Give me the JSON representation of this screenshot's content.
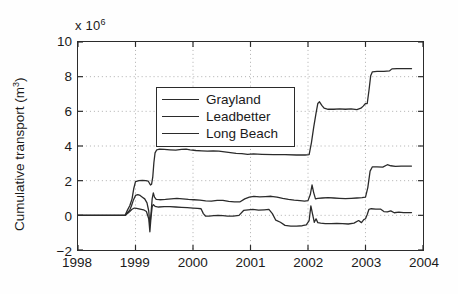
{
  "figure": {
    "exponent_label": "x 10",
    "exponent_power": "6",
    "ylabel_text": "Cumulative transport (m",
    "ylabel_sup": "3",
    "ylabel_close": ")",
    "axis_color": "#2b2b2b",
    "grid_color": "#9a9a9a",
    "background": "#ffffff"
  },
  "legend": {
    "position": "top-left-inside",
    "entries": [
      {
        "label": "Grayland",
        "color": "#2b2b2b"
      },
      {
        "label": "Leadbetter",
        "color": "#2b2b2b"
      },
      {
        "label": "Long Beach",
        "color": "#2b2b2b"
      }
    ]
  },
  "chart_data": {
    "type": "line",
    "title": "",
    "xlabel": "",
    "ylabel": "Cumulative transport (m^3)",
    "y_scale_factor": 1000000,
    "xlim": [
      1998,
      2004
    ],
    "ylim": [
      -2,
      10
    ],
    "xticks": [
      1998,
      1999,
      2000,
      2001,
      2002,
      2003,
      2004
    ],
    "yticks": [
      -2,
      0,
      2,
      4,
      6,
      8,
      10
    ],
    "grid": "dotted-both-axes",
    "series": [
      {
        "name": "Grayland",
        "color": "#2b2b2b",
        "points": [
          [
            1998.0,
            0.0
          ],
          [
            1998.82,
            0.0
          ],
          [
            1998.86,
            0.3
          ],
          [
            1998.9,
            0.55
          ],
          [
            1998.94,
            0.95
          ],
          [
            1998.97,
            1.55
          ],
          [
            1999.0,
            1.95
          ],
          [
            1999.06,
            2.0
          ],
          [
            1999.12,
            2.02
          ],
          [
            1999.18,
            2.0
          ],
          [
            1999.22,
            1.98
          ],
          [
            1999.26,
            1.75
          ],
          [
            1999.28,
            1.8
          ],
          [
            1999.3,
            2.2
          ],
          [
            1999.32,
            3.05
          ],
          [
            1999.34,
            3.6
          ],
          [
            1999.37,
            3.78
          ],
          [
            1999.42,
            3.82
          ],
          [
            1999.5,
            3.8
          ],
          [
            1999.6,
            3.78
          ],
          [
            1999.7,
            3.76
          ],
          [
            1999.8,
            3.8
          ],
          [
            1999.88,
            3.82
          ],
          [
            1999.95,
            3.78
          ],
          [
            2000.05,
            3.74
          ],
          [
            2000.15,
            3.72
          ],
          [
            2000.25,
            3.7
          ],
          [
            2000.35,
            3.72
          ],
          [
            2000.45,
            3.7
          ],
          [
            2000.55,
            3.66
          ],
          [
            2000.65,
            3.62
          ],
          [
            2000.75,
            3.58
          ],
          [
            2000.85,
            3.56
          ],
          [
            2000.95,
            3.52
          ],
          [
            2001.05,
            3.54
          ],
          [
            2001.2,
            3.52
          ],
          [
            2001.4,
            3.5
          ],
          [
            2001.6,
            3.5
          ],
          [
            2001.8,
            3.48
          ],
          [
            2001.95,
            3.48
          ],
          [
            2002.02,
            3.5
          ],
          [
            2002.06,
            4.2
          ],
          [
            2002.1,
            5.1
          ],
          [
            2002.14,
            5.9
          ],
          [
            2002.17,
            6.45
          ],
          [
            2002.2,
            6.55
          ],
          [
            2002.24,
            6.35
          ],
          [
            2002.28,
            6.18
          ],
          [
            2002.35,
            6.12
          ],
          [
            2002.45,
            6.12
          ],
          [
            2002.55,
            6.14
          ],
          [
            2002.65,
            6.12
          ],
          [
            2002.75,
            6.14
          ],
          [
            2002.85,
            6.1
          ],
          [
            2002.92,
            6.18
          ],
          [
            2002.96,
            6.3
          ],
          [
            2003.0,
            6.45
          ],
          [
            2003.03,
            6.45
          ],
          [
            2003.06,
            7.2
          ],
          [
            2003.09,
            8.05
          ],
          [
            2003.12,
            8.28
          ],
          [
            2003.2,
            8.3
          ],
          [
            2003.32,
            8.3
          ],
          [
            2003.42,
            8.34
          ],
          [
            2003.46,
            8.45
          ],
          [
            2003.55,
            8.46
          ],
          [
            2003.65,
            8.46
          ],
          [
            2003.75,
            8.46
          ],
          [
            2003.8,
            8.46
          ]
        ]
      },
      {
        "name": "Leadbetter",
        "color": "#2b2b2b",
        "points": [
          [
            1998.0,
            0.0
          ],
          [
            1998.82,
            0.0
          ],
          [
            1998.86,
            0.15
          ],
          [
            1998.9,
            0.3
          ],
          [
            1998.93,
            0.55
          ],
          [
            1998.96,
            0.85
          ],
          [
            1999.0,
            1.15
          ],
          [
            1999.04,
            1.2
          ],
          [
            1999.08,
            1.15
          ],
          [
            1999.12,
            1.05
          ],
          [
            1999.16,
            0.95
          ],
          [
            1999.2,
            0.72
          ],
          [
            1999.23,
            0.25
          ],
          [
            1999.25,
            -0.55
          ],
          [
            1999.27,
            0.1
          ],
          [
            1999.29,
            0.95
          ],
          [
            1999.31,
            1.3
          ],
          [
            1999.33,
            1.05
          ],
          [
            1999.36,
            0.92
          ],
          [
            1999.42,
            0.9
          ],
          [
            1999.52,
            0.92
          ],
          [
            1999.62,
            0.95
          ],
          [
            1999.72,
            0.98
          ],
          [
            1999.82,
            0.95
          ],
          [
            1999.92,
            0.92
          ],
          [
            2000.02,
            0.9
          ],
          [
            2000.12,
            0.88
          ],
          [
            2000.22,
            0.84
          ],
          [
            2000.32,
            0.82
          ],
          [
            2000.42,
            0.86
          ],
          [
            2000.52,
            0.86
          ],
          [
            2000.62,
            0.8
          ],
          [
            2000.72,
            0.78
          ],
          [
            2000.82,
            0.78
          ],
          [
            2000.9,
            0.95
          ],
          [
            2000.98,
            1.05
          ],
          [
            2001.06,
            1.1
          ],
          [
            2001.16,
            1.06
          ],
          [
            2001.26,
            1.08
          ],
          [
            2001.36,
            1.1
          ],
          [
            2001.46,
            1.05
          ],
          [
            2001.56,
            0.98
          ],
          [
            2001.66,
            0.92
          ],
          [
            2001.76,
            0.88
          ],
          [
            2001.86,
            0.85
          ],
          [
            2001.94,
            0.82
          ],
          [
            2002.0,
            0.85
          ],
          [
            2002.04,
            1.2
          ],
          [
            2002.07,
            1.75
          ],
          [
            2002.1,
            1.3
          ],
          [
            2002.13,
            0.95
          ],
          [
            2002.17,
            0.98
          ],
          [
            2002.25,
            1.0
          ],
          [
            2002.35,
            1.02
          ],
          [
            2002.45,
            1.0
          ],
          [
            2002.55,
            0.98
          ],
          [
            2002.65,
            0.96
          ],
          [
            2002.75,
            0.98
          ],
          [
            2002.85,
            1.0
          ],
          [
            2002.94,
            1.02
          ],
          [
            2003.0,
            1.05
          ],
          [
            2003.04,
            1.6
          ],
          [
            2003.08,
            2.55
          ],
          [
            2003.12,
            2.8
          ],
          [
            2003.2,
            2.8
          ],
          [
            2003.3,
            2.78
          ],
          [
            2003.38,
            2.92
          ],
          [
            2003.44,
            2.86
          ],
          [
            2003.52,
            2.82
          ],
          [
            2003.62,
            2.84
          ],
          [
            2003.72,
            2.84
          ],
          [
            2003.8,
            2.84
          ]
        ]
      },
      {
        "name": "Long Beach",
        "color": "#2b2b2b",
        "points": [
          [
            1998.0,
            0.0
          ],
          [
            1998.82,
            0.0
          ],
          [
            1998.86,
            0.1
          ],
          [
            1998.9,
            0.22
          ],
          [
            1998.94,
            0.35
          ],
          [
            1998.98,
            0.42
          ],
          [
            1999.02,
            0.4
          ],
          [
            1999.08,
            0.36
          ],
          [
            1999.14,
            0.32
          ],
          [
            1999.19,
            0.22
          ],
          [
            1999.23,
            -0.2
          ],
          [
            1999.25,
            -0.95
          ],
          [
            1999.27,
            -0.1
          ],
          [
            1999.29,
            0.5
          ],
          [
            1999.31,
            0.62
          ],
          [
            1999.34,
            0.52
          ],
          [
            1999.4,
            0.48
          ],
          [
            1999.5,
            0.5
          ],
          [
            1999.6,
            0.5
          ],
          [
            1999.7,
            0.48
          ],
          [
            1999.8,
            0.46
          ],
          [
            1999.9,
            0.44
          ],
          [
            2000.0,
            0.42
          ],
          [
            2000.08,
            0.4
          ],
          [
            2000.14,
            0.38
          ],
          [
            2000.18,
            0.1
          ],
          [
            2000.22,
            -0.05
          ],
          [
            2000.28,
            -0.05
          ],
          [
            2000.36,
            -0.02
          ],
          [
            2000.44,
            0.0
          ],
          [
            2000.52,
            -0.02
          ],
          [
            2000.6,
            -0.05
          ],
          [
            2000.7,
            -0.05
          ],
          [
            2000.8,
            0.0
          ],
          [
            2000.88,
            0.28
          ],
          [
            2000.96,
            0.32
          ],
          [
            2001.04,
            0.34
          ],
          [
            2001.14,
            0.3
          ],
          [
            2001.24,
            0.32
          ],
          [
            2001.32,
            0.34
          ],
          [
            2001.38,
            0.1
          ],
          [
            2001.44,
            -0.28
          ],
          [
            2001.52,
            -0.4
          ],
          [
            2001.6,
            -0.58
          ],
          [
            2001.7,
            -0.62
          ],
          [
            2001.8,
            -0.62
          ],
          [
            2001.9,
            -0.6
          ],
          [
            2001.97,
            -0.55
          ],
          [
            2002.02,
            -0.3
          ],
          [
            2002.05,
            0.55
          ],
          [
            2002.08,
            0.05
          ],
          [
            2002.11,
            -0.4
          ],
          [
            2002.14,
            -0.2
          ],
          [
            2002.17,
            -0.42
          ],
          [
            2002.22,
            -0.45
          ],
          [
            2002.3,
            -0.48
          ],
          [
            2002.4,
            -0.48
          ],
          [
            2002.5,
            -0.46
          ],
          [
            2002.6,
            -0.48
          ],
          [
            2002.7,
            -0.5
          ],
          [
            2002.8,
            -0.45
          ],
          [
            2002.88,
            -0.3
          ],
          [
            2002.93,
            -0.42
          ],
          [
            2002.97,
            -0.25
          ],
          [
            2003.0,
            -0.2
          ],
          [
            2003.03,
            0.05
          ],
          [
            2003.06,
            0.35
          ],
          [
            2003.1,
            0.38
          ],
          [
            2003.18,
            0.36
          ],
          [
            2003.26,
            0.36
          ],
          [
            2003.32,
            0.22
          ],
          [
            2003.38,
            0.2
          ],
          [
            2003.44,
            0.26
          ],
          [
            2003.5,
            0.15
          ],
          [
            2003.58,
            0.18
          ],
          [
            2003.66,
            0.16
          ],
          [
            2003.74,
            0.16
          ],
          [
            2003.8,
            0.16
          ]
        ]
      }
    ]
  }
}
